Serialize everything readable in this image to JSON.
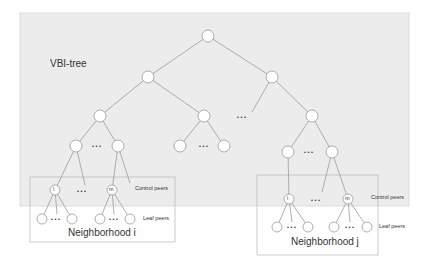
{
  "diagram": {
    "title": "VBI-tree",
    "labels": {
      "control_peers_i": "Control peers",
      "leaf_peers_i": "Leaf peers",
      "control_peers_j": "Control peers",
      "leaf_peers_j": "Leaf peers",
      "neighborhood_i": "Neighborhood i",
      "neighborhood_j": "Neighborhood j",
      "node_l": "l",
      "node_m": "m",
      "ellipsis": "• • •"
    },
    "colors": {
      "tree_background": "#ececec",
      "edge": "#9a9a9a",
      "node_fill": "#ffffff",
      "box_border": "#bdbdbd"
    }
  }
}
